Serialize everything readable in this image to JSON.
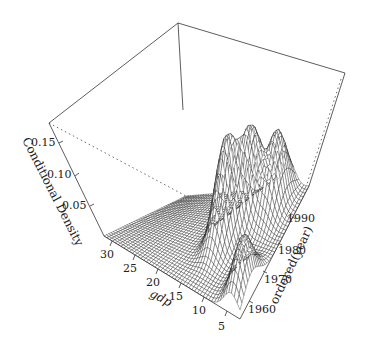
{
  "chart_data": {
    "type": "surface3d",
    "title": "",
    "zlabel": "Conditional Density",
    "xlabel": "gdp",
    "ylabel": "ordered(year)",
    "x_ticks": [
      5,
      10,
      15,
      20,
      25,
      30
    ],
    "y_ticks": [
      1960,
      1970,
      1980,
      1990
    ],
    "z_ticks": [
      0.05,
      0.1,
      0.15
    ],
    "x_range": [
      3,
      33
    ],
    "y_range": [
      1955,
      1997
    ],
    "z_range": [
      0,
      0.18
    ],
    "surface_description": "Wireframe conditional density surface; flat near zero for gdp > 20, peaks ~0.15 near gdp 12-16 for early-to-mid years, secondary ridge ~0.12 near gdp 8-10, sharp spike along low gdp at 1960 edge",
    "peaks": [
      {
        "gdp": 14,
        "year": 1975,
        "density": 0.16
      },
      {
        "gdp": 12,
        "year": 1985,
        "density": 0.14
      },
      {
        "gdp": 8,
        "year": 1990,
        "density": 0.12
      },
      {
        "gdp": 5,
        "year": 1962,
        "density": 0.09
      }
    ],
    "style": {
      "surface_fill": "#ffffff",
      "wire_color": "#111111",
      "box_color": "#333333",
      "background": "#ffffff"
    }
  },
  "axes": {
    "z_title": "Conditional Density",
    "x_title": "gdp",
    "y_title": "ordered(year)",
    "z_tick_labels": [
      "0.05",
      "0.10",
      "0.15"
    ],
    "x_tick_labels": [
      "30",
      "25",
      "20",
      "15",
      "10",
      "5"
    ],
    "y_tick_labels": [
      "1960",
      "1970",
      "1980",
      "1990"
    ]
  }
}
